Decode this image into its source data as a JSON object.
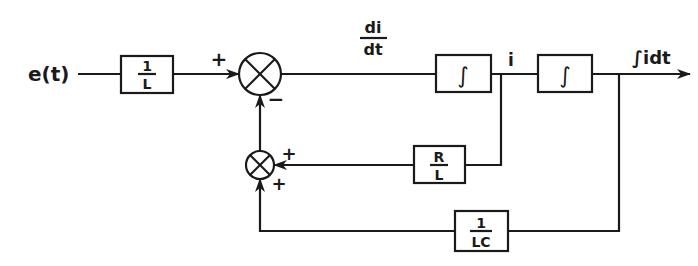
{
  "diagram": {
    "type": "block-diagram",
    "title": "",
    "input": {
      "label": "e(t)"
    },
    "output": {
      "label": "∫idt"
    },
    "blocks": [
      {
        "id": "gain_1_over_L",
        "numerator": "1",
        "denominator": "L"
      },
      {
        "id": "integrator_1",
        "symbol": "∫"
      },
      {
        "id": "integrator_2",
        "symbol": "∫"
      },
      {
        "id": "gain_R_over_L",
        "numerator": "R",
        "denominator": "L"
      },
      {
        "id": "gain_1_over_LC",
        "numerator": "1",
        "denominator": "LC"
      }
    ],
    "summing_junctions": [
      {
        "id": "main_sum",
        "signs": {
          "input": "+",
          "feedback": "−"
        }
      },
      {
        "id": "feedback_sum",
        "signs": {
          "from_R_over_L": "+",
          "from_1_over_LC": "+"
        }
      }
    ],
    "signals": {
      "derivative": {
        "numerator": "di",
        "denominator": "dt"
      },
      "current": "i"
    }
  }
}
